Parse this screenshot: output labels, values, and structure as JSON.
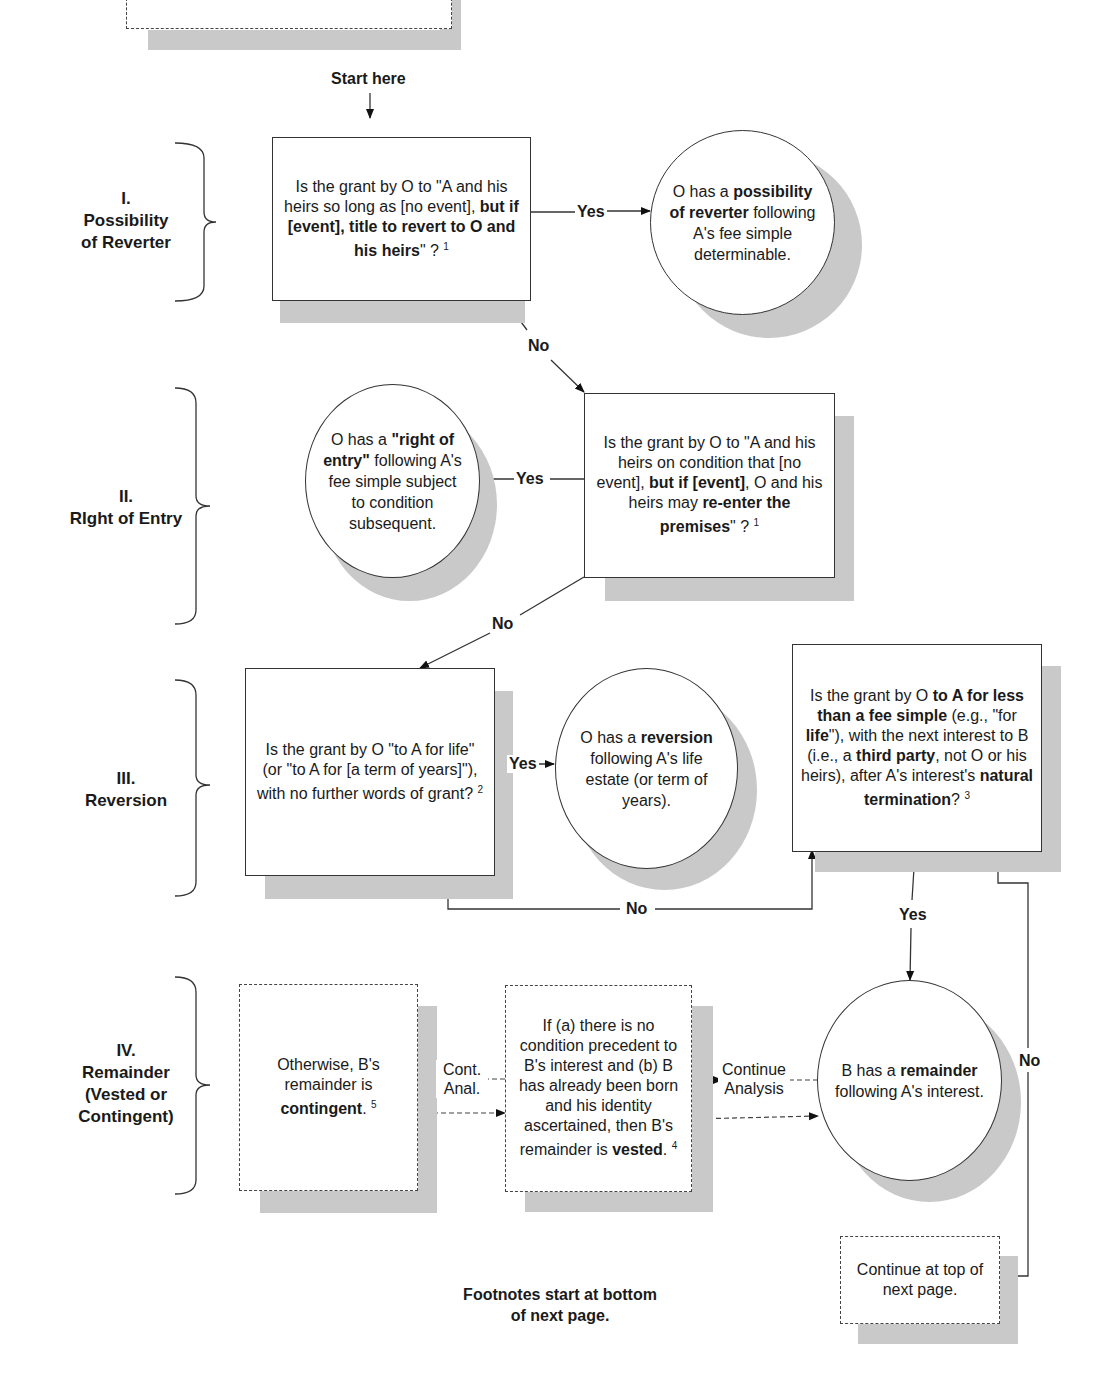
{
  "start_label": "Start here",
  "sections": [
    {
      "numeral": "I.",
      "title_lines": [
        "Possibility",
        "of Reverter"
      ]
    },
    {
      "numeral": "II.",
      "title_lines": [
        "RIght of Entry"
      ]
    },
    {
      "numeral": "III.",
      "title_lines": [
        "Reversion"
      ]
    },
    {
      "numeral": "IV.",
      "title_lines": [
        "Remainder",
        "(Vested or",
        "Contingent)"
      ]
    }
  ],
  "nodes": {
    "q1": {
      "parts": [
        "Is the grant by O to \"A and his heirs so long as [no event], ",
        "but if [event], title to revert to O and his heirs",
        "\" ? "
      ],
      "footnote": "1"
    },
    "r1": {
      "parts": [
        "O has a ",
        "possibility of reverter",
        " following A's fee simple determinable."
      ]
    },
    "q2": {
      "parts": [
        "Is the grant by O to \"A and his heirs on condition that [no event], ",
        "but if [event]",
        ", O and his heirs may ",
        "re-enter the premises",
        "\" ? "
      ],
      "footnote": "1"
    },
    "r2": {
      "parts": [
        "O has a ",
        "\"right of entry\"",
        " following A's fee simple subject to condition subsequent."
      ]
    },
    "q3": {
      "parts": [
        "Is the grant by O \"to A for life\" (or \"to A for [a term of years]\"), with no further words of grant? "
      ],
      "footnote": "2"
    },
    "r3": {
      "parts": [
        "O has a ",
        "reversion",
        " following A's life estate (or term of years)."
      ]
    },
    "q4": {
      "parts": [
        "Is the grant by O ",
        "to A for less than a fee simple",
        " (e.g., \"for ",
        "life",
        "\"), with the next interest to B (i.e., a ",
        "third party",
        ", not O or his heirs), after A's interest's ",
        "natural termination",
        "? "
      ],
      "footnote": "3"
    },
    "r4": {
      "parts": [
        "B has a ",
        "remainder",
        " following A's interest."
      ]
    },
    "vested": {
      "parts": [
        "If (a) there is no condition precedent to B's interest and (b) B has already been born and his identity ascertained, then B's remainder is ",
        "vested",
        ". "
      ],
      "footnote": "4"
    },
    "contingent": {
      "parts": [
        "Otherwise, B's remainder is ",
        "contingent",
        ". "
      ],
      "footnote": "5"
    },
    "continue_next": {
      "text": "Continue at top of next page."
    }
  },
  "edge_labels": {
    "yes": "Yes",
    "no": "No",
    "cont_anal_1": "Cont.",
    "cont_anal_2": "Anal.",
    "continue_analysis_1": "Continue",
    "continue_analysis_2": "Analysis"
  },
  "footer_note": {
    "line1": "Footnotes start at bottom",
    "line2": "of next page."
  }
}
